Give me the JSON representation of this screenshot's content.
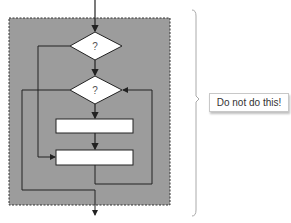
{
  "diagram": {
    "decisions": [
      {
        "label": "?"
      },
      {
        "label": "?"
      }
    ],
    "processes": [
      {
        "label": ""
      },
      {
        "label": ""
      }
    ],
    "region_fill": "#999999",
    "line_color": "#222222"
  },
  "callout": {
    "text": "Do not do this!"
  }
}
